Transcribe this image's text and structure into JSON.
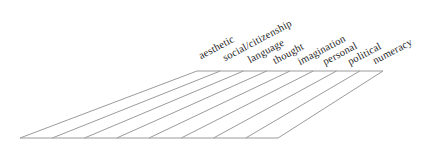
{
  "figure": {
    "type": "perspective-plane-with-labeled-strips",
    "strip_labels": [
      "aesthetic",
      "social/citizenship",
      "language",
      "thought",
      "imagination",
      "personal",
      "political",
      "numeracy"
    ],
    "strip_count": 8,
    "colors": {
      "line": "#9b9b9b",
      "label_text": "#1f1f1f",
      "background": "#ffffff"
    }
  }
}
